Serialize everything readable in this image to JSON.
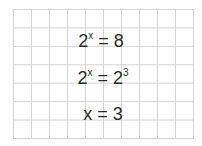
{
  "equations": [
    {
      "base": "2",
      "exponent": "x",
      "equals": "=",
      "rhs": "8",
      "rhs_exponent": ""
    },
    {
      "base": "2",
      "exponent": "x",
      "equals": "=",
      "rhs": "2",
      "rhs_exponent": "3"
    },
    {
      "base": "x",
      "exponent": "",
      "equals": "=",
      "rhs": "3",
      "rhs_exponent": ""
    }
  ],
  "colors": {
    "grid_line": "#d4d4d4",
    "text": "#2a2a2a",
    "background": "#ffffff"
  }
}
